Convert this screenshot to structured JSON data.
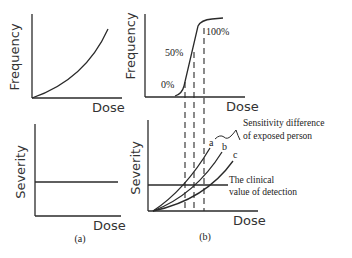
{
  "figure": {
    "panel_a": {
      "caption": "(a)",
      "top_chart": {
        "ylabel": "Frequency",
        "xlabel": "Dose"
      },
      "bottom_chart": {
        "ylabel": "Severity",
        "xlabel": "Dose"
      }
    },
    "panel_b": {
      "caption": "(b)",
      "top_chart": {
        "ylabel": "Frequency",
        "xlabel": "Dose",
        "labels": {
          "p0": "0%",
          "p50": "50%",
          "p100": "100%"
        }
      },
      "bottom_chart": {
        "ylabel": "Severity",
        "xlabel": "Dose",
        "curves": {
          "a": "a",
          "b": "b",
          "c": "c"
        },
        "annotation_sensitivity_line1": "Sensitivity difference",
        "annotation_sensitivity_line2": "of exposed person",
        "annotation_clinical_line1": "The clinical",
        "annotation_clinical_line2": "value of detection"
      }
    },
    "colors": {
      "line": "#2a2a2a",
      "text": "#333333",
      "background": "#ffffff"
    }
  }
}
